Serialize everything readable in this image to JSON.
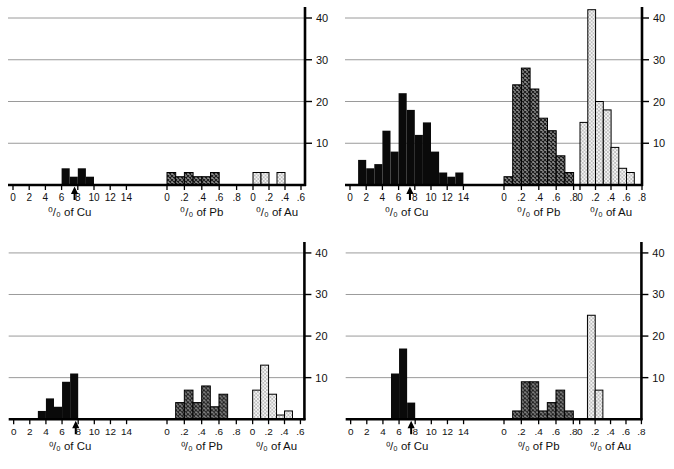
{
  "figure_title": "",
  "colors": {
    "bar_fill": "#0a0a0a",
    "axis": "#000000",
    "grid": "#9a9a9a",
    "text": "#111111",
    "pb_base": "#8f8f8f",
    "pb_line": "#1a1a1a",
    "au_base": "#f5f5f5",
    "au_dot": "#6e6e6e"
  },
  "chart_data": [
    {
      "id": "top-left",
      "type": "bar",
      "ylim": [
        0,
        40
      ],
      "yticks": [
        "10",
        "20",
        "30",
        "40"
      ],
      "grid": true,
      "arrow_x": 7.6,
      "groups": [
        {
          "name": "Cu",
          "xlabel": "⁰/₀ of Cu",
          "pattern": "solid",
          "xticks": [
            "0",
            "2",
            "4",
            "6",
            "8",
            "10",
            "12",
            "14"
          ],
          "tick_step": 2,
          "bin_start": 6,
          "bin_width": 1,
          "values": [
            4,
            2,
            4,
            2
          ]
        },
        {
          "name": "Pb",
          "xlabel": "⁰/₀ of Pb",
          "pattern": "crosshatch",
          "xticks": [
            "0",
            ".2",
            ".4",
            ".6",
            ".8"
          ],
          "tick_step": 0.2,
          "bin_start": 0,
          "bin_width": 0.1,
          "values": [
            3,
            2,
            3,
            2,
            2,
            3
          ]
        },
        {
          "name": "Au",
          "xlabel": "⁰/₀ of Au",
          "pattern": "stipple",
          "xticks": [
            "0",
            ".2",
            ".4",
            ".6"
          ],
          "tick_step": 0.2,
          "bin_start": 0,
          "bin_width": 0.1,
          "values": [
            3,
            3,
            0,
            3
          ]
        }
      ]
    },
    {
      "id": "top-right",
      "type": "bar",
      "ylim": [
        0,
        40
      ],
      "yticks": [
        "10",
        "20",
        "30",
        "40"
      ],
      "grid": true,
      "arrow_x": 7.4,
      "groups": [
        {
          "name": "Cu",
          "xlabel": "⁰/₀ of Cu",
          "pattern": "solid",
          "xticks": [
            "0",
            "2",
            "4",
            "6",
            "8",
            "10",
            "12",
            "14"
          ],
          "tick_step": 2,
          "bin_start": 1,
          "bin_width": 1,
          "values": [
            6,
            4,
            5,
            13,
            8,
            22,
            18,
            12,
            15,
            8,
            3,
            2,
            3
          ]
        },
        {
          "name": "Pb",
          "xlabel": "⁰/₀ of Pb",
          "pattern": "crosshatch",
          "xticks": [
            "0",
            ".2",
            ".4",
            ".6",
            ".8"
          ],
          "tick_step": 0.2,
          "bin_start": 0,
          "bin_width": 0.1,
          "values": [
            2,
            24,
            28,
            23,
            16,
            13,
            7,
            3
          ]
        },
        {
          "name": "Au",
          "xlabel": "⁰/₀ of Au",
          "pattern": "stipple",
          "xticks": [
            "0",
            ".2",
            ".4",
            ".6",
            ".8"
          ],
          "tick_step": 0.2,
          "bin_start": 0,
          "bin_width": 0.1,
          "values": [
            15,
            42,
            20,
            18,
            9,
            4,
            3
          ]
        }
      ]
    },
    {
      "id": "bottom-left",
      "type": "bar",
      "ylim": [
        0,
        40
      ],
      "yticks": [
        "10",
        "20",
        "30",
        "40"
      ],
      "grid": true,
      "arrow_x": 7.7,
      "groups": [
        {
          "name": "Cu",
          "xlabel": "⁰/₀ of Cu",
          "pattern": "solid",
          "xticks": [
            "0",
            "2",
            "4",
            "6",
            "8",
            "10",
            "12",
            "14"
          ],
          "tick_step": 2,
          "bin_start": 3,
          "bin_width": 1,
          "values": [
            2,
            5,
            3,
            9,
            11
          ]
        },
        {
          "name": "Pb",
          "xlabel": "⁰/₀ of Pb",
          "pattern": "crosshatch",
          "xticks": [
            "0",
            ".2",
            ".4",
            ".6",
            ".8"
          ],
          "tick_step": 0.2,
          "bin_start": 0.1,
          "bin_width": 0.1,
          "values": [
            4,
            7,
            4,
            8,
            3,
            6
          ]
        },
        {
          "name": "Au",
          "xlabel": "⁰/₀ of Au",
          "pattern": "stipple",
          "xticks": [
            "0",
            ".2",
            ".4",
            ".6"
          ],
          "tick_step": 0.2,
          "bin_start": 0,
          "bin_width": 0.1,
          "values": [
            7,
            13,
            6,
            1,
            2
          ]
        }
      ]
    },
    {
      "id": "bottom-right",
      "type": "bar",
      "ylim": [
        0,
        40
      ],
      "yticks": [
        "10",
        "20",
        "30",
        "40"
      ],
      "grid": true,
      "arrow_x": 7.5,
      "groups": [
        {
          "name": "Cu",
          "xlabel": "⁰/₀ of Cu",
          "pattern": "solid",
          "xticks": [
            "0",
            "2",
            "4",
            "6",
            "8",
            "10",
            "12",
            "14"
          ],
          "tick_step": 2,
          "bin_start": 5,
          "bin_width": 1,
          "values": [
            11,
            17,
            4
          ]
        },
        {
          "name": "Pb",
          "xlabel": "⁰/₀ of Pb",
          "pattern": "crosshatch",
          "xticks": [
            "0",
            ".2",
            ".4",
            ".6",
            ".8"
          ],
          "tick_step": 0.2,
          "bin_start": 0.1,
          "bin_width": 0.1,
          "values": [
            2,
            9,
            9,
            2,
            4,
            7,
            2
          ]
        },
        {
          "name": "Au",
          "xlabel": "⁰/₀ of Au",
          "pattern": "stipple",
          "xticks": [
            "0",
            ".2",
            ".4",
            ".6",
            ".8"
          ],
          "tick_step": 0.2,
          "bin_start": 0.1,
          "bin_width": 0.1,
          "values": [
            25,
            7
          ]
        }
      ]
    }
  ]
}
